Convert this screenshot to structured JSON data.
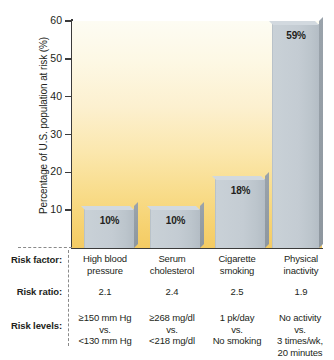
{
  "chart_data": {
    "type": "bar",
    "title": "",
    "xlabel": "",
    "ylabel": "Percentage of U.S. population at risk (%)",
    "ylim": [
      0,
      60
    ],
    "yticks": [
      0,
      10,
      20,
      30,
      40,
      50,
      60
    ],
    "ytick_labels": [
      "",
      "10",
      "20",
      "30",
      "40",
      "50",
      "60"
    ],
    "grid": false,
    "legend": "none",
    "categories": [
      "High blood pressure",
      "Serum cholesterol",
      "Cigarette smoking",
      "Physical inactivity"
    ],
    "values": [
      10,
      10,
      18,
      59
    ],
    "data_labels": [
      "10%",
      "10%",
      "18%",
      "59%"
    ],
    "bar_color": "#c4ccd3",
    "bar_shadow_color": "#929ba3",
    "plot_background": "vertical gradient cream to golden yellow",
    "plot_background_top": "#fdfcf3",
    "plot_background_bottom": "#f4cb63"
  },
  "axis": {
    "ticks": [
      {
        "label": "60",
        "value": 60
      },
      {
        "label": "50",
        "value": 50
      },
      {
        "label": "40",
        "value": 40
      },
      {
        "label": "30",
        "value": 30
      },
      {
        "label": "20",
        "value": 20
      },
      {
        "label": "10",
        "value": 10
      }
    ],
    "title": "Percentage of U.S. population at risk (%)"
  },
  "bars": [
    {
      "label": "10%",
      "value": 10
    },
    {
      "label": "10%",
      "value": 10
    },
    {
      "label": "18%",
      "value": 18
    },
    {
      "label": "59%",
      "value": 59
    }
  ],
  "table": {
    "row_labels": [
      "Risk factor:",
      "Risk ratio:",
      "Risk levels:"
    ],
    "columns": [
      {
        "risk_factor": "High blood\npressure",
        "risk_factor_line1": "High blood",
        "risk_factor_line2": "pressure",
        "risk_ratio": "2.1",
        "risk_levels_line1": "≥150 mm Hg",
        "risk_levels_line2": "vs.",
        "risk_levels_line3": "<130 mm Hg",
        "risk_levels_line4": ""
      },
      {
        "risk_factor_line1": "Serum",
        "risk_factor_line2": "cholesterol",
        "risk_ratio": "2.4",
        "risk_levels_line1": "≥268 mg/dl",
        "risk_levels_line2": "vs.",
        "risk_levels_line3": "<218 mg/dl",
        "risk_levels_line4": ""
      },
      {
        "risk_factor_line1": "Cigarette",
        "risk_factor_line2": "smoking",
        "risk_ratio": "2.5",
        "risk_levels_line1": "1 pk/day",
        "risk_levels_line2": "vs.",
        "risk_levels_line3": "No smoking",
        "risk_levels_line4": ""
      },
      {
        "risk_factor_line1": "Physical",
        "risk_factor_line2": "inactivity",
        "risk_ratio": "1.9",
        "risk_levels_line1": "No activity",
        "risk_levels_line2": "vs.",
        "risk_levels_line3": "3 times/wk,",
        "risk_levels_line4": "20 minutes"
      }
    ]
  }
}
